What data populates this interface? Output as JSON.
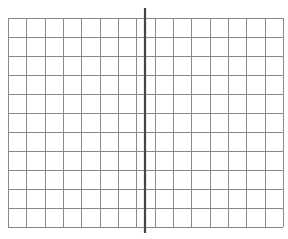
{
  "diagram": {
    "type": "grid-with-divider",
    "background": "#ffffff",
    "grid": {
      "left": 8,
      "top": 18,
      "right": 283,
      "bottom": 227,
      "columns": 15,
      "rows": 11,
      "line_color": "#8a8a8a",
      "line_width": 1
    },
    "divider": {
      "orientation": "vertical",
      "x": 145,
      "y_start": 8,
      "y_end": 233,
      "color": "#444444",
      "width": 2.2
    }
  }
}
